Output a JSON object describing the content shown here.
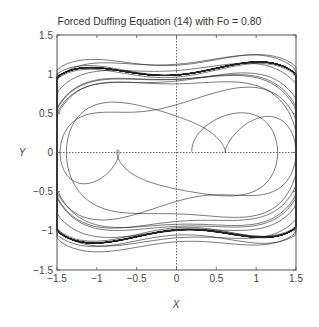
{
  "chart_data": {
    "type": "line",
    "title": "Forced Duffing Equation (14) with Fo = 0.80",
    "xlabel": "X",
    "ylabel": "Y",
    "xlim": [
      -1.5,
      1.5
    ],
    "ylim": [
      -1.5,
      1.5
    ],
    "xticks": [
      -1.5,
      -1,
      -0.5,
      0,
      0.5,
      1,
      1.5
    ],
    "yticks": [
      -1.5,
      -1,
      -0.5,
      0,
      0.5,
      1,
      1.5
    ],
    "xtick_labels": [
      "-1.5",
      "-1",
      "-0.5",
      "0",
      "0.5",
      "1",
      "1.5"
    ],
    "ytick_labels": [
      "-1.5",
      "-1",
      "-0.5",
      "0",
      "0.5",
      "1",
      "1.5"
    ],
    "grid": false,
    "zero_lines": "dotted",
    "legend": null,
    "series": [
      {
        "name": "phase trajectory",
        "description": "Phase portrait (x vs y=dx/dt) of forced Duffing oscillator, Fo = 0.80; two-lobed attractor",
        "model": {
          "equation": "x'' + k x' - x + x^3 = Fo cos(w t)",
          "Fo": 0.8,
          "k": 0.3,
          "w": 1.2,
          "x0": 0.2,
          "y0": 0.0,
          "dt": 0.02,
          "steps": 9000
        },
        "key_points": [
          {
            "x": -1.45,
            "y": 0.0
          },
          {
            "x": -1.2,
            "y": 0.48
          },
          {
            "x": -0.6,
            "y": 0.6
          },
          {
            "x": 0.0,
            "y": 0.45
          },
          {
            "x": 0.6,
            "y": 0.6
          },
          {
            "x": 1.2,
            "y": 0.45
          },
          {
            "x": 1.45,
            "y": 0.0
          },
          {
            "x": 1.2,
            "y": -0.45
          },
          {
            "x": 0.6,
            "y": -0.55
          },
          {
            "x": 0.0,
            "y": -0.4
          },
          {
            "x": -0.6,
            "y": -0.55
          },
          {
            "x": -1.2,
            "y": -0.48
          },
          {
            "x": -1.45,
            "y": 0.0
          }
        ]
      }
    ]
  }
}
